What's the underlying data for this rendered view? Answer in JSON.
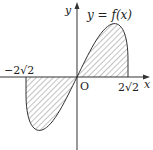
{
  "diagram": {
    "function_label": "y = f(x)",
    "axis_x_label": "x",
    "axis_y_label": "y",
    "origin_label": "O",
    "left_root_label": "−2√2",
    "right_root_label": "2√2",
    "curve": "odd function crossing origin, max between 0 and 2√2, min between −2√2 and 0",
    "shaded_regions": [
      "between curve and x-axis on [−2√2, 0]",
      "between curve and x-axis on [0, 2√2]"
    ],
    "colors": {
      "stroke": "#333333",
      "hatch": "#555555",
      "background": "#ffffff"
    }
  }
}
